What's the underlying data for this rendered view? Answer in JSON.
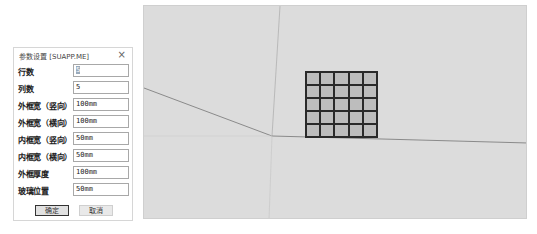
{
  "dialog": {
    "title": "参数设置 [SUAPP.ME]",
    "close_icon": "×",
    "fields": [
      {
        "label": "行数",
        "value": "5"
      },
      {
        "label": "列数",
        "value": "5"
      },
      {
        "label": "外框宽（竖向）",
        "value": "100mm"
      },
      {
        "label": "外框宽（横向）",
        "value": "100mm"
      },
      {
        "label": "内框宽（竖向）",
        "value": "50mm"
      },
      {
        "label": "内框宽（横向）",
        "value": "50mm"
      },
      {
        "label": "外框厚度",
        "value": "100mm"
      },
      {
        "label": "玻璃位置",
        "value": "50mm"
      }
    ],
    "ok_label": "确定",
    "cancel_label": "取消"
  },
  "viewport": {
    "grid_rows": 5,
    "grid_cols": 5
  }
}
